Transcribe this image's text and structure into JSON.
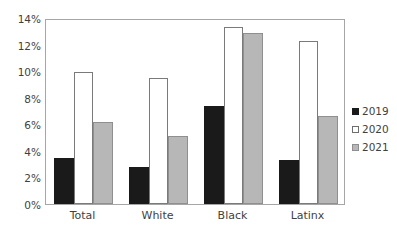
{
  "chart_data": {
    "type": "bar",
    "title": "",
    "xlabel": "",
    "ylabel": "",
    "categories": [
      "Total",
      "White",
      "Black",
      "Latinx"
    ],
    "series": [
      {
        "name": "2019",
        "color": "#1a1a1a",
        "values": [
          3.5,
          2.8,
          7.4,
          3.3
        ]
      },
      {
        "name": "2020",
        "color": "#ffffff",
        "values": [
          9.9,
          9.5,
          13.3,
          12.3
        ]
      },
      {
        "name": "2021",
        "color": "#b7b7b7",
        "values": [
          6.2,
          5.1,
          12.9,
          6.6
        ]
      }
    ],
    "ylim": [
      0,
      14
    ],
    "ytick_step": 2,
    "ytick_labels": [
      "0%",
      "2%",
      "4%",
      "6%",
      "8%",
      "10%",
      "12%",
      "14%"
    ],
    "ytick_values": [
      0,
      2,
      4,
      6,
      8,
      10,
      12,
      14
    ],
    "grid": false,
    "legend_position": "right"
  },
  "legend": {
    "entries": [
      {
        "label": "2019"
      },
      {
        "label": "2020"
      },
      {
        "label": "2021"
      }
    ]
  },
  "caption": {
    "clipped_text": ""
  }
}
